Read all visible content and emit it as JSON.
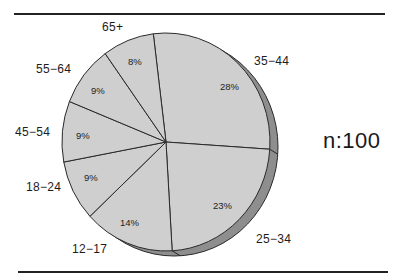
{
  "chart_data": {
    "type": "pie",
    "title": "",
    "sample_size_label": "n:100",
    "start_angle_deg": -7,
    "direction": "clockwise",
    "categories": [
      "35-44",
      "25-34",
      "12-17",
      "18-24",
      "45-54",
      "55-64",
      "65+"
    ],
    "values": [
      28,
      23,
      14,
      9,
      9,
      9,
      8
    ],
    "value_labels": [
      "28%",
      "23%",
      "14%",
      "9%",
      "9%",
      "9%",
      "8%"
    ],
    "style": {
      "face_color": "#cfcfcf",
      "side_color": "#8e8e8e",
      "edge_color": "#2a2a2a",
      "three_d": true
    }
  },
  "labels": {
    "n": "n:100",
    "cat": {
      "c35_44": "35−44",
      "c25_34": "25−34",
      "c12_17": "12−17",
      "c18_24": "18−24",
      "c45_54": "45−54",
      "c55_64": "55−64",
      "c65": "65+"
    },
    "pct": {
      "c35_44": "28%",
      "c25_34": "23%",
      "c12_17": "14%",
      "c18_24": "9%",
      "c45_54": "9%",
      "c55_64": "9%",
      "c65": "8%"
    }
  }
}
